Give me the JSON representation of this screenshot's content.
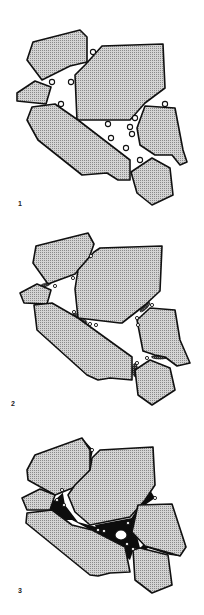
{
  "figure": {
    "colors": {
      "grain_fill": "#c8c8c8",
      "grain_dots": "#8a8a8a",
      "outline": "#111111",
      "cement": "#0d0d0d",
      "pore": "#ffffff"
    },
    "panels": [
      {
        "id": 1,
        "label": "1",
        "stage": "loose grains with pore space and gas bubbles"
      },
      {
        "id": 2,
        "label": "2",
        "stage": "grains in contact, pressure solution at contacts"
      },
      {
        "id": 3,
        "label": "3",
        "stage": "pore space filled with cement, residual bubbles"
      }
    ]
  }
}
